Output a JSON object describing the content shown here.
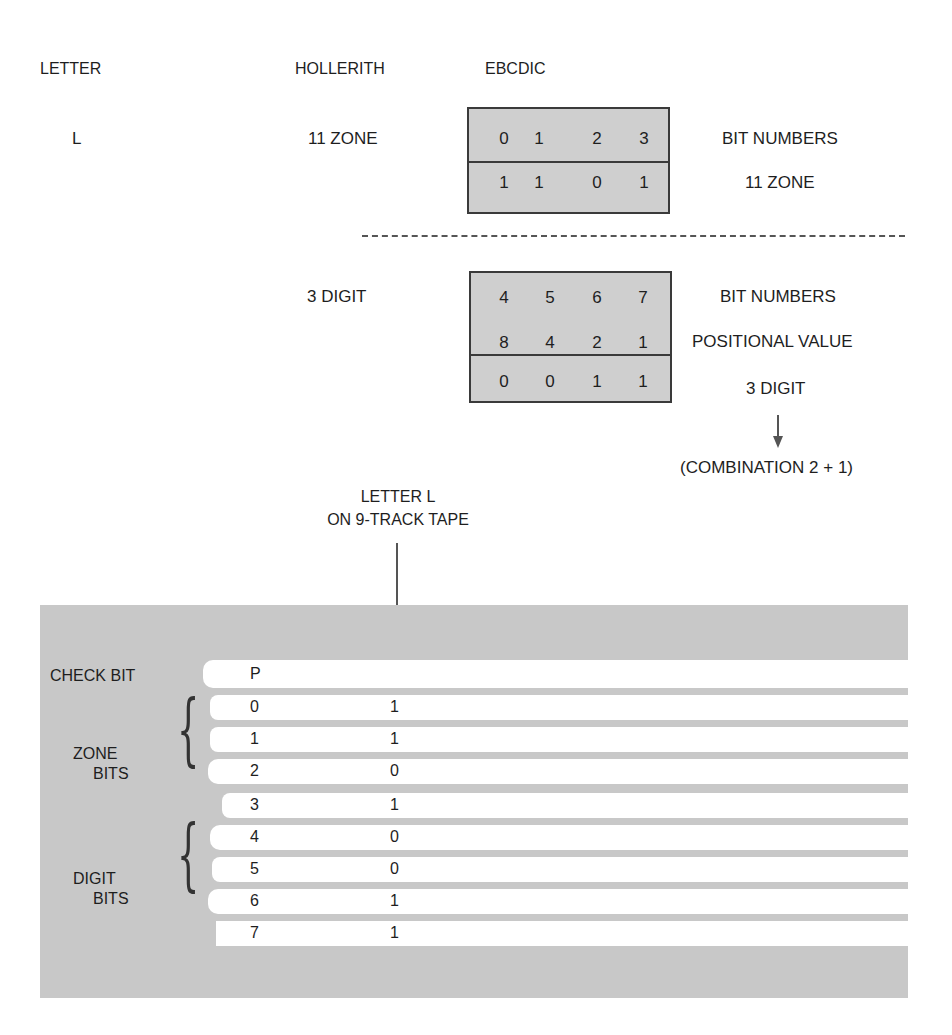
{
  "headers": {
    "letter": "LETTER",
    "hollerith": "HOLLERITH",
    "ebcdic": "EBCDIC"
  },
  "letter_value": "L",
  "zone_section": {
    "hollerith_label": "11 ZONE",
    "box_rows": [
      {
        "cells": [
          "0",
          "1",
          "2",
          "3"
        ],
        "label": "BIT NUMBERS"
      },
      {
        "cells": [
          "1",
          "1",
          "0",
          "1"
        ],
        "label": "11 ZONE"
      }
    ]
  },
  "digit_section": {
    "hollerith_label": "3 DIGIT",
    "box_rows": [
      {
        "cells": [
          "4",
          "5",
          "6",
          "7"
        ],
        "label": "BIT NUMBERS"
      },
      {
        "cells": [
          "8",
          "4",
          "2",
          "1"
        ],
        "label": "POSITIONAL VALUE"
      },
      {
        "cells": [
          "0",
          "0",
          "1",
          "1"
        ],
        "label": "3 DIGIT"
      }
    ],
    "combination_note": "(COMBINATION 2 + 1)"
  },
  "tape_caption": {
    "line1": "LETTER L",
    "line2": "ON 9-TRACK TAPE"
  },
  "tape": {
    "check_bit_label": "CHECK BIT",
    "zone_bits_label_1": "ZONE",
    "zone_bits_label_2": "BITS",
    "digit_bits_label_1": "DIGIT",
    "digit_bits_label_2": "BITS",
    "tracks": [
      {
        "bit": "P",
        "value": ""
      },
      {
        "bit": "0",
        "value": "1"
      },
      {
        "bit": "1",
        "value": "1"
      },
      {
        "bit": "2",
        "value": "0"
      },
      {
        "bit": "3",
        "value": "1"
      },
      {
        "bit": "4",
        "value": "0"
      },
      {
        "bit": "5",
        "value": "0"
      },
      {
        "bit": "6",
        "value": "1"
      },
      {
        "bit": "7",
        "value": "1"
      }
    ]
  },
  "colors": {
    "box_fill": "#cfcfcf",
    "tape_fill": "#c8c8c8",
    "track_fill": "#ffffff",
    "line": "#3a3a3a"
  }
}
